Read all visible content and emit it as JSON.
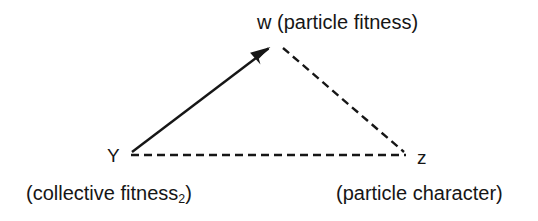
{
  "diagram": {
    "background_color": "#ffffff",
    "stroke_color": "#161616",
    "nodes": [
      {
        "id": "w",
        "symbol": "w",
        "label": "w (particle fitness)",
        "position": "top",
        "x": 276,
        "y": 45
      },
      {
        "id": "Y",
        "symbol": "Y",
        "label": "(collective fitness",
        "label_subscript": "2",
        "label_suffix": ")",
        "position": "bottom-left",
        "x": 130,
        "y": 155
      },
      {
        "id": "z",
        "symbol": "z",
        "label": "(particle character)",
        "position": "bottom-right",
        "x": 410,
        "y": 155
      }
    ],
    "edges": [
      {
        "id": "Y-to-w",
        "from": "Y",
        "to": "w",
        "style": "solid",
        "arrowhead": "filled-triangle",
        "arrow_at": "w"
      },
      {
        "id": "w-to-z",
        "from": "w",
        "to": "z",
        "style": "dashed",
        "arrowhead": "none"
      },
      {
        "id": "Y-to-z",
        "from": "Y",
        "to": "z",
        "style": "dashed",
        "arrowhead": "none"
      }
    ]
  },
  "labels": {
    "top_node": "w (particle fitness)",
    "left_node_symbol": "Y",
    "right_node_symbol": "z",
    "left_caption_main": "(collective fitness",
    "left_caption_subscript": "2",
    "left_caption_close": ")",
    "right_caption": "(particle character)"
  }
}
